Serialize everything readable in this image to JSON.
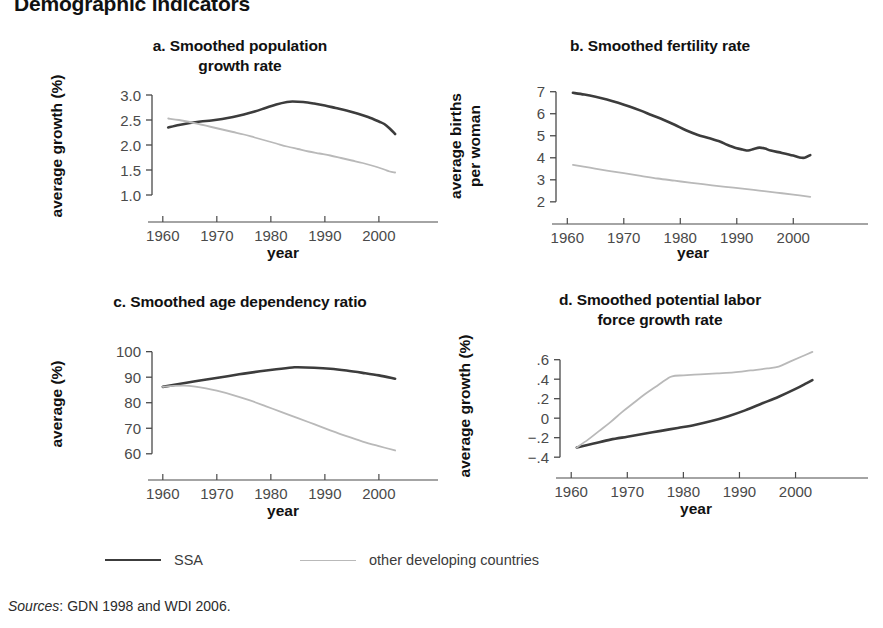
{
  "figure": {
    "title": "Demographic indicators",
    "sources_prefix": "Sources",
    "sources_text": ": GDN 1998 and WDI 2006."
  },
  "colors": {
    "ssa": "#3c3c3c",
    "other": "#b9b9b9",
    "axis": "#4a4a4a",
    "text": "#111111",
    "tick_text": "#4a4a4a",
    "background": "#ffffff"
  },
  "legend": {
    "position": "bottom-left",
    "items": [
      {
        "label": "SSA",
        "color": "#3c3c3c",
        "width": 2.6
      },
      {
        "label": "other developing countries",
        "color": "#b9b9b9",
        "width": 1.8
      }
    ]
  },
  "chart_data": [
    {
      "id": "panel-a",
      "type": "line",
      "panel_letter": "a.",
      "title": "a. Smoothed population growth rate",
      "title_lines": [
        "a. Smoothed population",
        "growth rate"
      ],
      "xlabel": "year",
      "ylabel": "average growth (%)",
      "ylabel_lines": [
        "average growth (%)"
      ],
      "xlim": [
        1958,
        2006.5
      ],
      "ylim": [
        0.78,
        3.18
      ],
      "xticks": [
        1960,
        1970,
        1980,
        1990,
        2000
      ],
      "xticklabels": [
        "1960",
        "1970",
        "1980",
        "1990",
        "2000"
      ],
      "yticks": [
        1.0,
        1.5,
        2.0,
        2.5,
        3.0
      ],
      "yticklabels": [
        "1.0",
        "1.5",
        "2.0",
        "2.5",
        "3.0"
      ],
      "grid": false,
      "legend": "external-bottom",
      "series": [
        {
          "name": "SSA",
          "color": "#3c3c3c",
          "x": [
            1961,
            1963,
            1965,
            1967,
            1969,
            1971,
            1973,
            1975,
            1977,
            1979,
            1981,
            1983,
            1984,
            1986,
            1988,
            1990,
            1992,
            1994,
            1996,
            1998,
            2000,
            2001,
            2002,
            2003
          ],
          "values": [
            2.35,
            2.4,
            2.44,
            2.47,
            2.49,
            2.52,
            2.56,
            2.61,
            2.67,
            2.74,
            2.81,
            2.86,
            2.87,
            2.86,
            2.83,
            2.79,
            2.74,
            2.69,
            2.63,
            2.56,
            2.47,
            2.42,
            2.33,
            2.22
          ]
        },
        {
          "name": "other developing countries",
          "color": "#b9b9b9",
          "x": [
            1961,
            1963,
            1965,
            1967,
            1969,
            1971,
            1973,
            1975,
            1977,
            1979,
            1981,
            1983,
            1985,
            1987,
            1989,
            1991,
            1993,
            1995,
            1997,
            1999,
            2001,
            2002,
            2003
          ],
          "values": [
            2.53,
            2.5,
            2.46,
            2.41,
            2.36,
            2.31,
            2.26,
            2.21,
            2.15,
            2.09,
            2.03,
            1.97,
            1.92,
            1.87,
            1.83,
            1.79,
            1.74,
            1.69,
            1.64,
            1.58,
            1.51,
            1.47,
            1.45
          ]
        }
      ]
    },
    {
      "id": "panel-b",
      "type": "line",
      "panel_letter": "b.",
      "title": "b. Smoothed fertility rate",
      "title_lines": [
        "b. Smoothed fertility rate"
      ],
      "xlabel": "year",
      "ylabel": "average births per woman",
      "ylabel_lines": [
        "average births",
        "per woman"
      ],
      "xlim": [
        1958,
        2006.5
      ],
      "ylim": [
        1.72,
        7.35
      ],
      "xticks": [
        1960,
        1970,
        1980,
        1990,
        2000
      ],
      "xticklabels": [
        "1960",
        "1970",
        "1980",
        "1990",
        "2000"
      ],
      "yticks": [
        2,
        3,
        4,
        5,
        6,
        7
      ],
      "yticklabels": [
        "2",
        "3",
        "4",
        "5",
        "6",
        "7"
      ],
      "grid": false,
      "legend": "external-bottom",
      "series": [
        {
          "name": "SSA",
          "color": "#3c3c3c",
          "x": [
            1961,
            1963,
            1965,
            1967,
            1969,
            1971,
            1973,
            1975,
            1977,
            1979,
            1981,
            1983,
            1985,
            1987,
            1988,
            1989,
            1990,
            1991,
            1992,
            1993,
            1994,
            1995,
            1996,
            1998,
            2000,
            2001,
            2002,
            2003
          ],
          "values": [
            6.95,
            6.87,
            6.77,
            6.65,
            6.5,
            6.33,
            6.14,
            5.93,
            5.73,
            5.5,
            5.25,
            5.05,
            4.9,
            4.74,
            4.62,
            4.52,
            4.43,
            4.38,
            4.33,
            4.4,
            4.46,
            4.42,
            4.33,
            4.22,
            4.1,
            4.02,
            4.0,
            4.12
          ]
        },
        {
          "name": "other developing countries",
          "color": "#b9b9b9",
          "x": [
            1961,
            1964,
            1967,
            1970,
            1973,
            1976,
            1979,
            1982,
            1985,
            1988,
            1991,
            1994,
            1997,
            2000,
            2003
          ],
          "values": [
            3.68,
            3.55,
            3.42,
            3.3,
            3.18,
            3.06,
            2.96,
            2.86,
            2.77,
            2.68,
            2.6,
            2.51,
            2.42,
            2.33,
            2.23
          ]
        }
      ]
    },
    {
      "id": "panel-c",
      "type": "line",
      "panel_letter": "c.",
      "title": "c. Smoothed age dependency ratio",
      "title_lines": [
        "c. Smoothed age dependency ratio"
      ],
      "xlabel": "year",
      "ylabel": "average (%)",
      "ylabel_lines": [
        "average (%)"
      ],
      "xlim": [
        1958,
        2006.5
      ],
      "ylim": [
        56,
        103
      ],
      "xticks": [
        1960,
        1970,
        1980,
        1990,
        2000
      ],
      "xticklabels": [
        "1960",
        "1970",
        "1980",
        "1990",
        "2000"
      ],
      "yticks": [
        60,
        70,
        80,
        90,
        100
      ],
      "yticklabels": [
        "60",
        "70",
        "80",
        "90",
        "100"
      ],
      "grid": false,
      "legend": "external-bottom",
      "series": [
        {
          "name": "SSA",
          "color": "#3c3c3c",
          "x": [
            1960,
            1963,
            1966,
            1969,
            1972,
            1975,
            1978,
            1981,
            1984,
            1985,
            1988,
            1991,
            1994,
            1997,
            2000,
            2003
          ],
          "values": [
            86.2,
            87.3,
            88.4,
            89.4,
            90.4,
            91.4,
            92.3,
            93.1,
            93.8,
            93.9,
            93.7,
            93.3,
            92.6,
            91.7,
            90.7,
            89.4
          ]
        },
        {
          "name": "other developing countries",
          "color": "#b9b9b9",
          "x": [
            1960,
            1962,
            1964,
            1966,
            1968,
            1970,
            1973,
            1976,
            1979,
            1982,
            1985,
            1988,
            1991,
            1994,
            1997,
            2000,
            2003
          ],
          "values": [
            86.2,
            86.6,
            86.7,
            86.3,
            85.6,
            84.7,
            83.0,
            81.0,
            78.7,
            76.3,
            74.0,
            71.6,
            69.2,
            66.9,
            64.8,
            63.0,
            61.3
          ]
        }
      ]
    },
    {
      "id": "panel-d",
      "type": "line",
      "panel_letter": "d.",
      "title": "d. Smoothed potential labor force growth rate",
      "title_lines": [
        "d. Smoothed potential labor",
        "force growth rate"
      ],
      "xlabel": "year",
      "ylabel": "average growth (%)",
      "ylabel_lines": [
        "average growth (%)"
      ],
      "xlim": [
        1958,
        2006.5
      ],
      "ylim": [
        -0.47,
        0.72
      ],
      "xticks": [
        1960,
        1970,
        1980,
        1990,
        2000
      ],
      "xticklabels": [
        "1960",
        "1970",
        "1980",
        "1990",
        "2000"
      ],
      "yticks": [
        -0.4,
        -0.2,
        0,
        0.2,
        0.4,
        0.6
      ],
      "yticklabels": [
        "−.4",
        "−.2",
        "0",
        ".2",
        ".4",
        ".6"
      ],
      "grid": false,
      "legend": "external-bottom",
      "series": [
        {
          "name": "SSA",
          "color": "#3c3c3c",
          "x": [
            1961,
            1964,
            1967,
            1970,
            1973,
            1976,
            1979,
            1982,
            1985,
            1988,
            1991,
            1994,
            1997,
            2000,
            2002,
            2003
          ],
          "values": [
            -0.3,
            -0.26,
            -0.22,
            -0.19,
            -0.16,
            -0.13,
            -0.1,
            -0.07,
            -0.03,
            0.02,
            0.08,
            0.15,
            0.22,
            0.3,
            0.36,
            0.39
          ]
        },
        {
          "name": "other developing countries",
          "color": "#b9b9b9",
          "x": [
            1961,
            1963,
            1965,
            1967,
            1969,
            1971,
            1973,
            1975,
            1977,
            1978,
            1980,
            1983,
            1986,
            1989,
            1992,
            1995,
            1997,
            1999,
            2001,
            2003
          ],
          "values": [
            -0.3,
            -0.22,
            -0.13,
            -0.04,
            0.06,
            0.15,
            0.24,
            0.32,
            0.4,
            0.43,
            0.44,
            0.45,
            0.46,
            0.47,
            0.49,
            0.51,
            0.53,
            0.58,
            0.63,
            0.68
          ]
        }
      ]
    }
  ]
}
